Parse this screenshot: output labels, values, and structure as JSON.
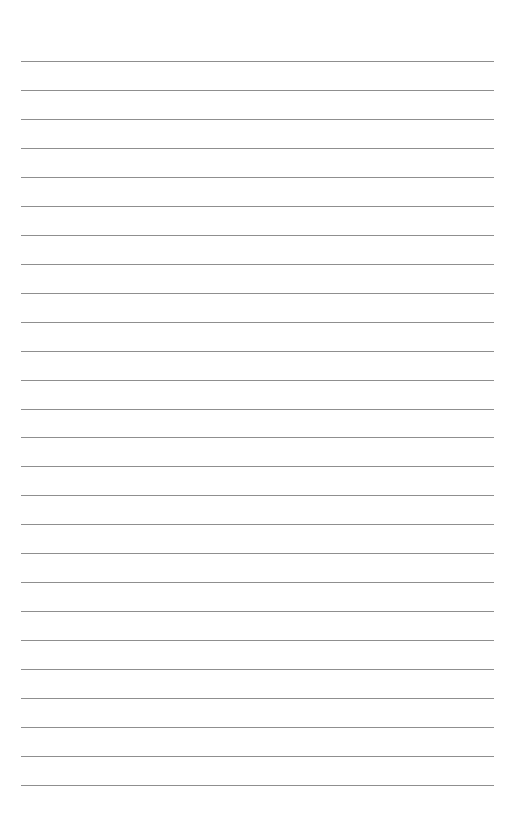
{
  "document": {
    "type": "ruled-paper",
    "line_count": 26,
    "line_color": "#8f8f8f",
    "text": ""
  }
}
